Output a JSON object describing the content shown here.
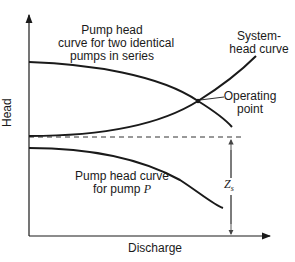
{
  "diagram": {
    "axes": {
      "y_label": "Head",
      "x_label": "Discharge"
    },
    "labels": {
      "series_curve": [
        "Pump head",
        "curve for two identical",
        "pumps in series"
      ],
      "system_curve": [
        "System-",
        "head curve"
      ],
      "operating_point": [
        "Operating",
        "point"
      ],
      "single_pump_line1": "Pump head curve",
      "single_pump_line2_prefix": "for pump ",
      "single_pump_line2_var": "P",
      "static_head_var": "Z",
      "static_head_sub": "s"
    },
    "colors": {
      "line": "#1a1a1a",
      "dimension": "#555555"
    }
  }
}
